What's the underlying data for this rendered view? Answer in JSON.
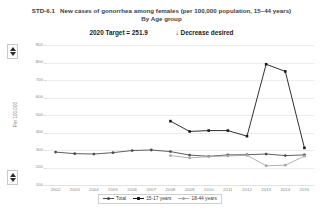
{
  "header": {
    "measure_id": "STD-6.1",
    "title": "New cases of gonorrhea among females (per 100,000 population, 15–44 years)",
    "subtitle": "By Age group",
    "target_label": "2020 Target = 251.9",
    "direction_arrow": "↓",
    "direction_label": "Decrease desired"
  },
  "controls": {
    "scroll_up_icon": "triangle-up-icon",
    "scroll_down_icon": "triangle-down-icon"
  },
  "chart_data": {
    "type": "line",
    "title": "New cases of gonorrhea among females (per 100,000 population, 15–44 years)",
    "subtitle": "By Age group",
    "xlabel": "",
    "ylabel": "Per 100,000",
    "ylim": [
      100,
      900
    ],
    "yticks": [
      900,
      800,
      700,
      600,
      500,
      400,
      300,
      200,
      100
    ],
    "grid": true,
    "legend_position": "bottom-center",
    "x": [
      2002,
      2003,
      2004,
      2005,
      2006,
      2007,
      2008,
      2009,
      2010,
      2011,
      2012,
      2013,
      2014,
      2015
    ],
    "categories": [
      "2002",
      "2003",
      "2004",
      "2005",
      "2006",
      "2007",
      "2008",
      "2009",
      "2010",
      "2011",
      "2012",
      "2013",
      "2014",
      "2015"
    ],
    "series": [
      {
        "name": "Total",
        "color": "#4d4d4d",
        "marker": "circle",
        "values": [
          288,
          279,
          277,
          285,
          297,
          300,
          291,
          271,
          264,
          272,
          273,
          277,
          268,
          272
        ]
      },
      {
        "name": "15-17 years",
        "color": "#1a1a1a",
        "marker": "square",
        "values": [
          null,
          null,
          null,
          null,
          null,
          null,
          465,
          406,
          411,
          411,
          379,
          790,
          749,
          312
        ]
      },
      {
        "name": "18-44 years",
        "color": "#a8a8a8",
        "marker": "circle",
        "values": [
          null,
          null,
          null,
          null,
          null,
          null,
          268,
          255,
          262,
          266,
          270,
          210,
          213,
          265
        ]
      }
    ],
    "target_value": 251.9
  },
  "legend": {
    "items": [
      {
        "label": "Total",
        "color": "#4d4d4d",
        "marker": "circle"
      },
      {
        "label": "15-17 years",
        "color": "#1a1a1a",
        "marker": "square"
      },
      {
        "label": "18-44 years",
        "color": "#a8a8a8",
        "marker": "circle"
      }
    ]
  }
}
